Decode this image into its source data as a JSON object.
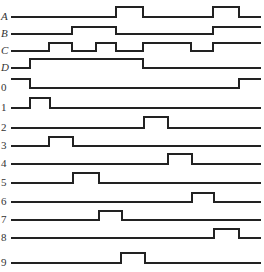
{
  "x_start": 11,
  "x_end": 261,
  "colors": {
    "line": "#222222",
    "label": "#333333",
    "background": "#ffffff"
  },
  "signals": [
    {
      "label": "A",
      "italic": true,
      "low_y": 17,
      "high_y": 7,
      "initial": 0,
      "edges": [
        116,
        143,
        213,
        239
      ]
    },
    {
      "label": "B",
      "italic": true,
      "low_y": 34,
      "high_y": 27,
      "initial": 0,
      "edges": [
        72,
        116,
        213
      ]
    },
    {
      "label": "C",
      "italic": true,
      "low_y": 51,
      "high_y": 43,
      "initial": 0,
      "edges": [
        49,
        72,
        96,
        116,
        143,
        191,
        213
      ]
    },
    {
      "label": "D",
      "italic": true,
      "low_y": 68,
      "high_y": 59,
      "initial": 0,
      "edges": [
        30,
        143
      ]
    },
    {
      "label": "0",
      "italic": false,
      "low_y": 88,
      "high_y": 79,
      "initial": 1,
      "edges": [
        30,
        239
      ]
    },
    {
      "label": "1",
      "italic": false,
      "low_y": 108,
      "high_y": 98,
      "initial": 0,
      "edges": [
        30,
        50
      ]
    },
    {
      "label": "2",
      "italic": false,
      "low_y": 128,
      "high_y": 117,
      "initial": 0,
      "edges": [
        144,
        168
      ]
    },
    {
      "label": "3",
      "italic": false,
      "low_y": 146,
      "high_y": 137,
      "initial": 0,
      "edges": [
        49,
        73
      ]
    },
    {
      "label": "4",
      "italic": false,
      "low_y": 164,
      "high_y": 154,
      "initial": 0,
      "edges": [
        168,
        192
      ]
    },
    {
      "label": "5",
      "italic": false,
      "low_y": 183,
      "high_y": 173,
      "initial": 0,
      "edges": [
        73,
        99
      ]
    },
    {
      "label": "6",
      "italic": false,
      "low_y": 202,
      "high_y": 193,
      "initial": 0,
      "edges": [
        192,
        214
      ]
    },
    {
      "label": "7",
      "italic": false,
      "low_y": 220,
      "high_y": 211,
      "initial": 0,
      "edges": [
        99,
        122
      ]
    },
    {
      "label": "8",
      "italic": false,
      "low_y": 238,
      "high_y": 229,
      "initial": 0,
      "edges": [
        214,
        239
      ]
    },
    {
      "label": "9",
      "italic": false,
      "low_y": 263,
      "high_y": 253,
      "initial": 0,
      "edges": [
        121,
        145
      ]
    }
  ]
}
